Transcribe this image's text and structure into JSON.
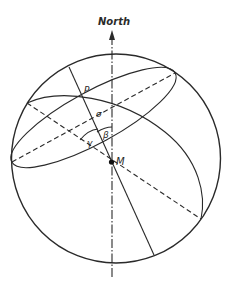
{
  "figure": {
    "title": "North",
    "labels": {
      "p": "P",
      "m": "M",
      "sigma": "σ",
      "beta": "β",
      "gamma": "γ"
    },
    "colors": {
      "stroke": "#2a2a2a",
      "background": "#ffffff"
    }
  }
}
